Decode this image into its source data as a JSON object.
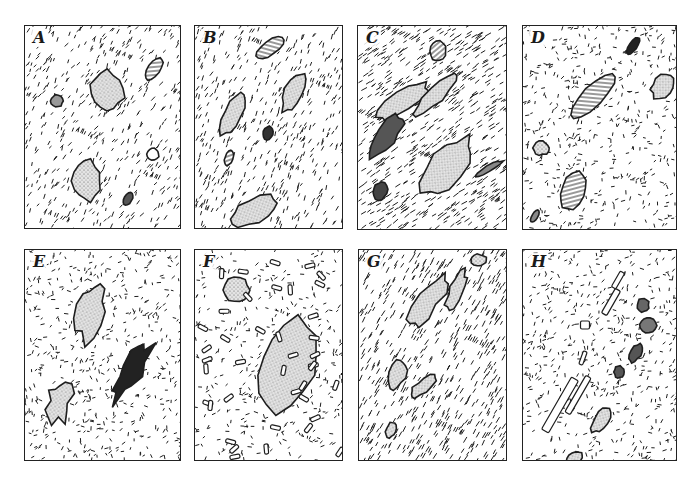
{
  "figure": {
    "panels": [
      {
        "label": "A",
        "texture": "fine dashes, crystals scattered",
        "ink": "#1e1e1e"
      },
      {
        "label": "B",
        "texture": "fine dashes, elongate stippled grains aligned NE",
        "ink": "#1e1e1e"
      },
      {
        "label": "C",
        "texture": "dense aligned dashes, elongate dark lenses",
        "ink": "#1e1e1e"
      },
      {
        "label": "D",
        "texture": "random dashes, striated prismatic crystals",
        "ink": "#1e1e1e"
      },
      {
        "label": "E",
        "texture": "random dashes, ragged stippled and dark clusters",
        "ink": "#1e1e1e"
      },
      {
        "label": "F",
        "texture": "scattered outlined laths, large stippled grain",
        "ink": "#1e1e1e"
      },
      {
        "label": "G",
        "texture": "strongly foliated band of grains trending NE",
        "ink": "#1e1e1e"
      },
      {
        "label": "H",
        "texture": "random dashes, aligned laths and small grains",
        "ink": "#1e1e1e"
      }
    ]
  },
  "colors": {
    "ink": "#1e1e1e",
    "background": "#ffffff",
    "stipple": "#cfcfcf"
  }
}
